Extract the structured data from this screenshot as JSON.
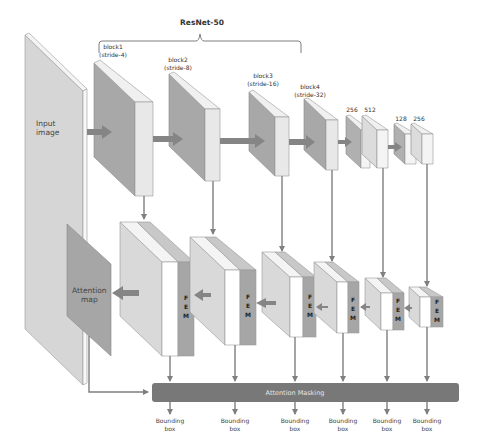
{
  "title": "ResNet-50",
  "input": {
    "line1": "Input",
    "line2": "image"
  },
  "backbone_blocks": [
    {
      "label": "block1",
      "stride": "(stride-4)"
    },
    {
      "label": "block2",
      "stride": "(stride-8)"
    },
    {
      "label": "block3",
      "stride": "(stride-16)"
    },
    {
      "label": "block4",
      "stride": "(stride-32)"
    }
  ],
  "extra_layers": [
    {
      "label": "256"
    },
    {
      "label": "512"
    },
    {
      "label": "128"
    },
    {
      "label": "256"
    }
  ],
  "fem_modules": [
    {
      "l1": "F",
      "l2": "E",
      "l3": "M"
    },
    {
      "l1": "F",
      "l2": "E",
      "l3": "M"
    },
    {
      "l1": "F",
      "l2": "E",
      "l3": "M"
    },
    {
      "l1": "F",
      "l2": "E",
      "l3": "M"
    },
    {
      "l1": "F",
      "l2": "E",
      "l3": "M"
    },
    {
      "l1": "F",
      "l2": "E",
      "l3": "M"
    }
  ],
  "attention_map": {
    "line1": "Attention",
    "line2": "map"
  },
  "attention_masking": {
    "label": "Attention Masking"
  },
  "outputs": [
    {
      "line1": "Bounding",
      "line2": "box"
    },
    {
      "line1": "Bounding",
      "line2": "box"
    },
    {
      "line1": "Bounding",
      "line2": "box"
    },
    {
      "line1": "Bounding",
      "line2": "box"
    },
    {
      "line1": "Bounding",
      "line2": "box"
    },
    {
      "line1": "Bounding",
      "line2": "box"
    }
  ],
  "colors": {
    "front_dark": "#a6a6a6",
    "front_light": "#d9d9d9",
    "side_light": "#ededed",
    "top_light": "#f2f2f2",
    "fem_gray": "#a6a6a6",
    "mask_bar": "#7a7a7a",
    "arrow": "#7f7f7f"
  }
}
